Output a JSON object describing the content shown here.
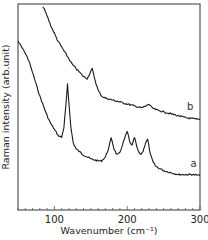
{
  "chart_data": {
    "type": "line",
    "title": "",
    "xlabel": "Wavenumber (cm⁻¹)",
    "ylabel": "Raman intensity (arb.unit)",
    "xlim": [
      50,
      300
    ],
    "ylim": [
      0,
      1
    ],
    "xticks": [
      100,
      200,
      300
    ],
    "xtick_labels": [
      "100",
      "200",
      "300"
    ],
    "minor_xtick_step": 10,
    "grid": false,
    "legend": "inline curve labels",
    "series": [
      {
        "name": "a",
        "label": "a",
        "x": [
          50,
          55,
          60,
          65,
          70,
          75,
          80,
          85,
          90,
          95,
          100,
          105,
          110,
          113,
          116,
          118,
          120,
          123,
          126,
          130,
          140,
          150,
          160,
          165,
          170,
          175,
          178,
          182,
          186,
          190,
          195,
          200,
          204,
          207,
          210,
          214,
          218,
          222,
          225,
          228,
          232,
          236,
          240,
          250,
          260,
          270,
          280,
          290,
          300
        ],
        "values": [
          0.82,
          0.79,
          0.76,
          0.72,
          0.66,
          0.6,
          0.54,
          0.49,
          0.44,
          0.4,
          0.37,
          0.34,
          0.33,
          0.38,
          0.5,
          0.6,
          0.5,
          0.37,
          0.3,
          0.27,
          0.24,
          0.22,
          0.21,
          0.21,
          0.23,
          0.28,
          0.33,
          0.27,
          0.24,
          0.25,
          0.31,
          0.36,
          0.3,
          0.29,
          0.33,
          0.27,
          0.24,
          0.26,
          0.3,
          0.32,
          0.24,
          0.2,
          0.18,
          0.16,
          0.15,
          0.14,
          0.14,
          0.14,
          0.135
        ]
      },
      {
        "name": "b",
        "label": "b",
        "x": [
          84,
          90,
          95,
          100,
          105,
          110,
          115,
          120,
          125,
          130,
          135,
          140,
          145,
          148,
          152,
          156,
          160,
          165,
          170,
          180,
          190,
          200,
          210,
          220,
          226,
          230,
          234,
          240,
          250,
          260,
          270,
          280,
          290,
          300
        ],
        "values": [
          1.0,
          0.95,
          0.9,
          0.86,
          0.82,
          0.79,
          0.76,
          0.73,
          0.7,
          0.68,
          0.66,
          0.64,
          0.63,
          0.65,
          0.68,
          0.62,
          0.57,
          0.54,
          0.53,
          0.52,
          0.51,
          0.5,
          0.49,
          0.48,
          0.49,
          0.5,
          0.48,
          0.47,
          0.46,
          0.45,
          0.44,
          0.43,
          0.425,
          0.42
        ]
      }
    ],
    "annotations": [
      {
        "text": "a",
        "x": 287,
        "y": 0.17,
        "series": "a"
      },
      {
        "text": "b",
        "x": 282,
        "y": 0.46,
        "series": "b"
      }
    ]
  },
  "labels": {
    "xlabel": "Wavenumber (cm⁻¹)",
    "ylabel": "Raman intensity (arb.unit)",
    "curve_a": "a",
    "curve_b": "b"
  },
  "style": {
    "line_color": "#1a1a1a",
    "frame_color": "#555555",
    "background": "#ffffff"
  }
}
